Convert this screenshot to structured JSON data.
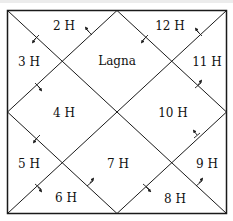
{
  "diagram": {
    "type": "north-indian-horoscope-chart",
    "center_label": "Lagna",
    "houses": [
      {
        "id": "lagna",
        "label": "Lagna",
        "x": 117,
        "y": 61
      },
      {
        "id": "h2",
        "label": "2 H",
        "x": 64,
        "y": 26
      },
      {
        "id": "h3",
        "label": "3 H",
        "x": 29,
        "y": 62
      },
      {
        "id": "h4",
        "label": "4 H",
        "x": 64,
        "y": 113
      },
      {
        "id": "h5",
        "label": "5 H",
        "x": 29,
        "y": 164
      },
      {
        "id": "h6",
        "label": "6 H",
        "x": 66,
        "y": 198
      },
      {
        "id": "h7",
        "label": "7 H",
        "x": 118,
        "y": 164
      },
      {
        "id": "h8",
        "label": "8 H",
        "x": 175,
        "y": 199
      },
      {
        "id": "h9",
        "label": "9 H",
        "x": 207,
        "y": 164
      },
      {
        "id": "h10",
        "label": "10 H",
        "x": 173,
        "y": 113
      },
      {
        "id": "h11",
        "label": "11 H",
        "x": 207,
        "y": 62
      },
      {
        "id": "h12",
        "label": "12 H",
        "x": 170,
        "y": 26
      }
    ],
    "colors": {
      "line": "#1a1a1a",
      "background": "#ffffff",
      "text": "#111111"
    }
  }
}
